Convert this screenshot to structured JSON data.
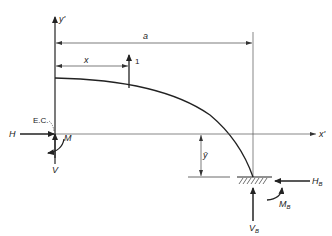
{
  "diagram": {
    "type": "structural-free-body-diagram",
    "labels": {
      "y_axis": "y'",
      "x_axis": "x'",
      "span": "a",
      "load_distance": "x",
      "unit_load": "1",
      "elastic_center": "E.C.",
      "H": "H",
      "M": "M",
      "V": "V",
      "y_bar": "ȳ",
      "H_B": "H",
      "H_B_sub": "B",
      "M_B": "M",
      "M_B_sub": "B",
      "V_B": "V",
      "V_B_sub": "B"
    },
    "colors": {
      "stroke": "#222222",
      "thin_stroke": "#555555",
      "background": "#ffffff"
    }
  }
}
